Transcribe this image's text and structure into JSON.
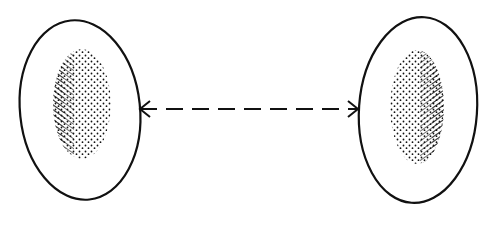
{
  "diagram": {
    "colors": {
      "background": "#ffffff",
      "ink": "#111111"
    },
    "nodes": [
      {
        "id": "left-cell",
        "shape": "ellipse",
        "cx": 80,
        "cy": 110,
        "rx": 60,
        "ry": 90,
        "nucleus": {
          "cx": 82,
          "cy": 104,
          "rx": 29,
          "ry": 55,
          "hatch_side": "left"
        }
      },
      {
        "id": "right-cell",
        "shape": "ellipse",
        "cx": 418,
        "cy": 110,
        "rx": 59,
        "ry": 93,
        "nucleus": {
          "cx": 417,
          "cy": 107,
          "rx": 27,
          "ry": 57,
          "hatch_side": "right"
        }
      }
    ],
    "edges": [
      {
        "from": "left-cell",
        "to": "right-cell",
        "style": "dashed",
        "arrowheads": "both",
        "y": 109
      }
    ]
  }
}
